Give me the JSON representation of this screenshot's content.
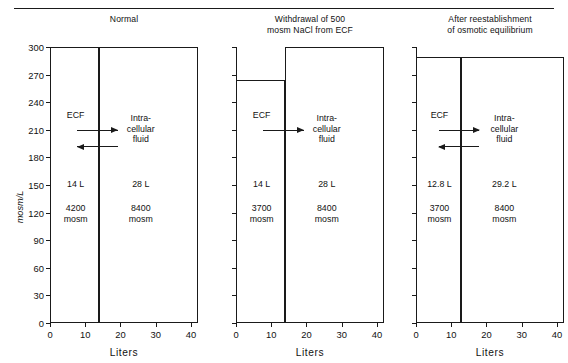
{
  "figure": {
    "y_axis_title": "mosm/L",
    "x_axis_title": "Liters",
    "y_ticks": [
      0,
      30,
      60,
      90,
      120,
      150,
      180,
      210,
      240,
      270,
      300
    ],
    "x_ticks": [
      0,
      10,
      20,
      30,
      40
    ],
    "y_range": [
      0,
      300
    ],
    "x_range": [
      0,
      42
    ],
    "ecf_label": "ECF",
    "icf_label_lines": [
      "Intra-",
      "cellular",
      "fluid"
    ]
  },
  "panels": [
    {
      "id": "normal",
      "title_lines": [
        "Normal"
      ],
      "ecf": {
        "volume_label": "14 L",
        "osmoles_lines": [
          "4200",
          "mosm"
        ],
        "volume_L": 14,
        "osmolarity": 300
      },
      "icf": {
        "volume_label": "28 L",
        "osmoles_lines": [
          "8400",
          "mosm"
        ],
        "volume_L": 28,
        "osmolarity": 300
      },
      "arrows": [
        {
          "direction": "right",
          "at_osm": 210
        },
        {
          "direction": "left",
          "at_osm": 192
        }
      ]
    },
    {
      "id": "withdrawal",
      "title_lines": [
        "Withdrawal of 500",
        "mosm NaCl from ECF"
      ],
      "ecf": {
        "volume_label": "14 L",
        "osmoles_lines": [
          "3700",
          "mosm"
        ],
        "volume_L": 14,
        "osmolarity": 264
      },
      "icf": {
        "volume_label": "28 L",
        "osmoles_lines": [
          "8400",
          "mosm"
        ],
        "volume_L": 28,
        "osmolarity": 300
      },
      "arrows": [
        {
          "direction": "right",
          "at_osm": 210
        }
      ]
    },
    {
      "id": "equilibrium",
      "title_lines": [
        "After reestablishment",
        "of osmotic equilibrium"
      ],
      "ecf": {
        "volume_label": "12.8 L",
        "osmoles_lines": [
          "3700",
          "mosm"
        ],
        "volume_L": 12.8,
        "osmolarity": 289
      },
      "icf": {
        "volume_label": "29.2 L",
        "osmoles_lines": [
          "8400",
          "mosm"
        ],
        "volume_L": 29.2,
        "osmolarity": 289
      },
      "arrows": [
        {
          "direction": "right",
          "at_osm": 210
        },
        {
          "direction": "left",
          "at_osm": 192
        }
      ]
    }
  ],
  "chart_data": {
    "type": "bar",
    "xlabel": "Liters",
    "ylabel": "mosm/L",
    "xlim": [
      0,
      42
    ],
    "ylim": [
      0,
      300
    ],
    "grid": false,
    "legend": "none",
    "panels": [
      {
        "title": "Normal",
        "categories": [
          "ECF",
          "Intracellular fluid"
        ],
        "widths_liters": [
          14,
          28
        ],
        "heights_mosm_per_L": [
          300,
          300
        ],
        "osmoles_mosm": [
          4200,
          8400
        ]
      },
      {
        "title": "Withdrawal of 500 mosm NaCl from ECF",
        "categories": [
          "ECF",
          "Intracellular fluid"
        ],
        "widths_liters": [
          14,
          28
        ],
        "heights_mosm_per_L": [
          264,
          300
        ],
        "osmoles_mosm": [
          3700,
          8400
        ]
      },
      {
        "title": "After reestablishment of osmotic equilibrium",
        "categories": [
          "ECF",
          "Intracellular fluid"
        ],
        "widths_liters": [
          12.8,
          29.2
        ],
        "heights_mosm_per_L": [
          289,
          289
        ],
        "osmoles_mosm": [
          3700,
          8400
        ]
      }
    ]
  }
}
